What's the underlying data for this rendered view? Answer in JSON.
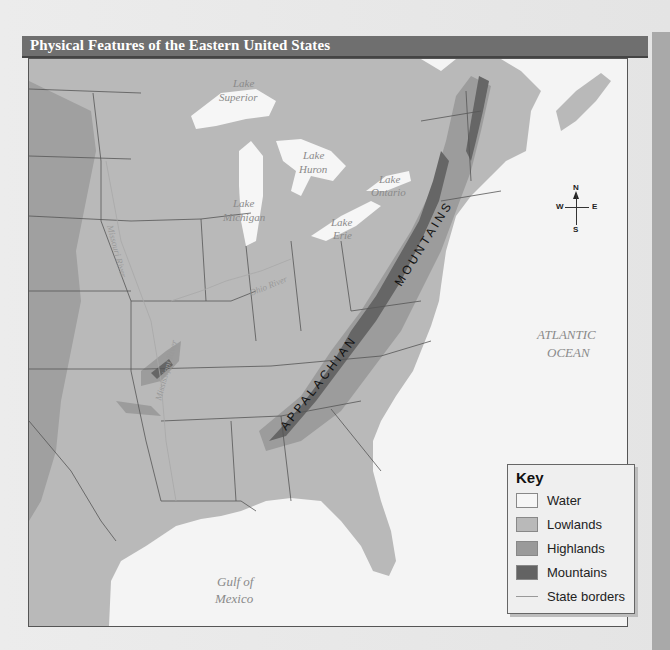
{
  "title": "Physical Features of the Eastern United States",
  "map": {
    "water_labels": [
      {
        "text": "Lake",
        "x": 232,
        "y": 86
      },
      {
        "text": "Superior",
        "x": 218,
        "y": 100
      },
      {
        "text": "Lake",
        "x": 302,
        "y": 158
      },
      {
        "text": "Huron",
        "x": 298,
        "y": 172
      },
      {
        "text": "Lake",
        "x": 232,
        "y": 206
      },
      {
        "text": "Michigan",
        "x": 222,
        "y": 220
      },
      {
        "text": "Lake",
        "x": 378,
        "y": 182
      },
      {
        "text": "Ontario",
        "x": 370,
        "y": 195
      },
      {
        "text": "Lake",
        "x": 330,
        "y": 225
      },
      {
        "text": "Erie",
        "x": 332,
        "y": 238
      },
      {
        "text": "ATLANTIC",
        "x": 536,
        "y": 338
      },
      {
        "text": "OCEAN",
        "x": 546,
        "y": 356
      },
      {
        "text": "Gulf of",
        "x": 216,
        "y": 585
      },
      {
        "text": "Mexico",
        "x": 214,
        "y": 602
      }
    ],
    "river_labels": [
      "Missouri River",
      "Ohio River",
      "Mississippi River"
    ],
    "mountain_label": {
      "part1": "APPALACHIAN",
      "part2": "MOUNTAINS"
    },
    "compass": {
      "n": "N",
      "s": "S",
      "e": "E",
      "w": "W"
    }
  },
  "key": {
    "title": "Key",
    "items": [
      {
        "label": "Water",
        "color": "#f6f6f6"
      },
      {
        "label": "Lowlands",
        "color": "#b9b9b9"
      },
      {
        "label": "Highlands",
        "color": "#9a9a9a"
      },
      {
        "label": "Mountains",
        "color": "#636363"
      },
      {
        "label": "State borders",
        "type": "line",
        "color": "#999999"
      }
    ]
  },
  "colors": {
    "water": "#f4f4f4",
    "lowlands": "#b8b8b8",
    "highlands": "#9b9b9b",
    "mountains": "#666666",
    "title_bar": "#6f6f6f"
  }
}
